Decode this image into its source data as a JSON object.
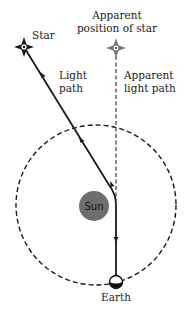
{
  "diagram": {
    "labels": {
      "star": "Star",
      "apparent_line1": "Apparent",
      "apparent_line2": "position of star",
      "light_line1": "Light",
      "light_line2": "path",
      "apparent_path_line1": "Apparent",
      "apparent_path_line2": "light path",
      "sun": "Sun",
      "earth": "Earth"
    },
    "colors": {
      "sun_fill": "#6e6e6e",
      "line": "#1a1a1a",
      "background": "#ffffff"
    },
    "nodes": [
      {
        "id": "star",
        "label": "Star",
        "icon": "star-icon"
      },
      {
        "id": "apparent-star",
        "label": "Apparent position of star",
        "icon": "star-icon"
      },
      {
        "id": "sun",
        "label": "Sun",
        "icon": "sun-disk"
      },
      {
        "id": "earth",
        "label": "Earth",
        "icon": "earth-icon"
      }
    ],
    "edges": [
      {
        "from": "star",
        "to": "earth",
        "label": "Light path",
        "style": "solid, bent near Sun"
      },
      {
        "from": "apparent-star",
        "to": "earth",
        "label": "Apparent light path",
        "style": "dashed"
      }
    ],
    "orbit": {
      "label": "Earth orbit",
      "style": "dashed circle"
    }
  }
}
